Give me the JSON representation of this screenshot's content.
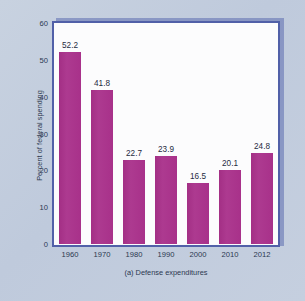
{
  "figure": {
    "background_color": "#c3cede",
    "plot_background_color": "#fbfbfd",
    "frame_color": "#5160a8",
    "bar_color": "#a8318a",
    "text_color": "#2b3850"
  },
  "caption": "(a) Defense expenditures",
  "chart_data": {
    "type": "bar",
    "title": "",
    "subtitle": "",
    "xlabel": "",
    "ylabel": "Percent of federal spending",
    "categories": [
      "1960",
      "1970",
      "1980",
      "1990",
      "2000",
      "2010",
      "2012"
    ],
    "values": [
      52.2,
      41.8,
      22.7,
      23.9,
      16.5,
      20.1,
      24.8
    ],
    "data_labels": [
      "52.2",
      "41.8",
      "22.7",
      "23.9",
      "16.5",
      "20.1",
      "24.8"
    ],
    "ylim": [
      0,
      60
    ],
    "yticks": [
      0,
      10,
      20,
      30,
      40,
      50,
      60
    ],
    "ytick_labels": [
      "0",
      "10",
      "20",
      "30",
      "40",
      "50",
      "60"
    ],
    "grid": false,
    "legend": null,
    "legend_position": "none",
    "annotations": [
      "(a) Defense expenditures"
    ]
  }
}
